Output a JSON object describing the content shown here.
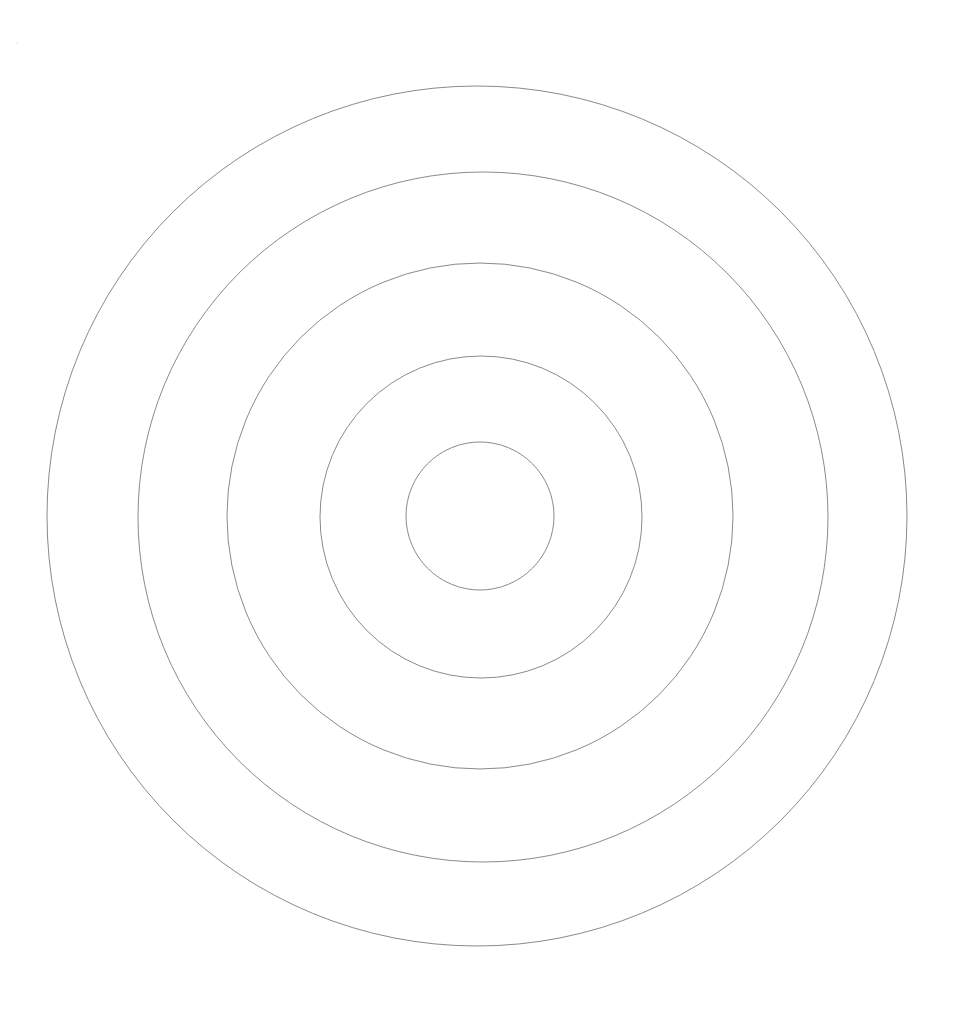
{
  "canvas": {
    "width": 955,
    "height": 1013,
    "background_color": "#ffffff",
    "title": "Concentric Circles"
  },
  "figure": {
    "name": "concentric-circles",
    "center_x": 480,
    "center_y": 516,
    "stroke_color": "#8a8a8a",
    "stroke_width": 1,
    "fill": "none",
    "ring_count": 5
  },
  "chart_data": {
    "type": "scatter",
    "title": "",
    "subtitle": "",
    "xlabel": "",
    "ylabel": "",
    "grid": false,
    "legend": "none",
    "xlim": [
      0,
      955
    ],
    "ylim": [
      0,
      1013
    ],
    "center": [
      480,
      516
    ],
    "categories": [
      "ring-1",
      "ring-2",
      "ring-3",
      "ring-4",
      "ring-5"
    ],
    "values": [
      74,
      161,
      253,
      345,
      430
    ],
    "series": [
      {
        "name": "radius",
        "values": [
          74,
          161,
          253,
          345,
          430
        ]
      },
      {
        "name": "diameter",
        "values": [
          148,
          322,
          506,
          690,
          860
        ]
      }
    ],
    "annotations": []
  },
  "rings": [
    {
      "id": "ring-1",
      "label": "innermost circle",
      "order": 1,
      "radius": 74,
      "diameter": 148,
      "cx": 480,
      "cy": 516,
      "stroke": "#8a8a8a",
      "stroke_width": 1
    },
    {
      "id": "ring-2",
      "label": "second circle",
      "order": 2,
      "radius": 161,
      "diameter": 322,
      "cx": 481,
      "cy": 517,
      "stroke": "#8a8a8a",
      "stroke_width": 1
    },
    {
      "id": "ring-3",
      "label": "third circle",
      "order": 3,
      "radius": 253,
      "diameter": 506,
      "cx": 480,
      "cy": 516,
      "stroke": "#8a8a8a",
      "stroke_width": 1
    },
    {
      "id": "ring-4",
      "label": "fourth circle",
      "order": 4,
      "radius": 345,
      "diameter": 690,
      "cx": 483,
      "cy": 517,
      "stroke": "#8a8a8a",
      "stroke_width": 1
    },
    {
      "id": "ring-5",
      "label": "outermost circle",
      "order": 5,
      "radius": 430,
      "diameter": 860,
      "cx": 477,
      "cy": 516,
      "stroke": "#8a8a8a",
      "stroke_width": 1
    }
  ]
}
